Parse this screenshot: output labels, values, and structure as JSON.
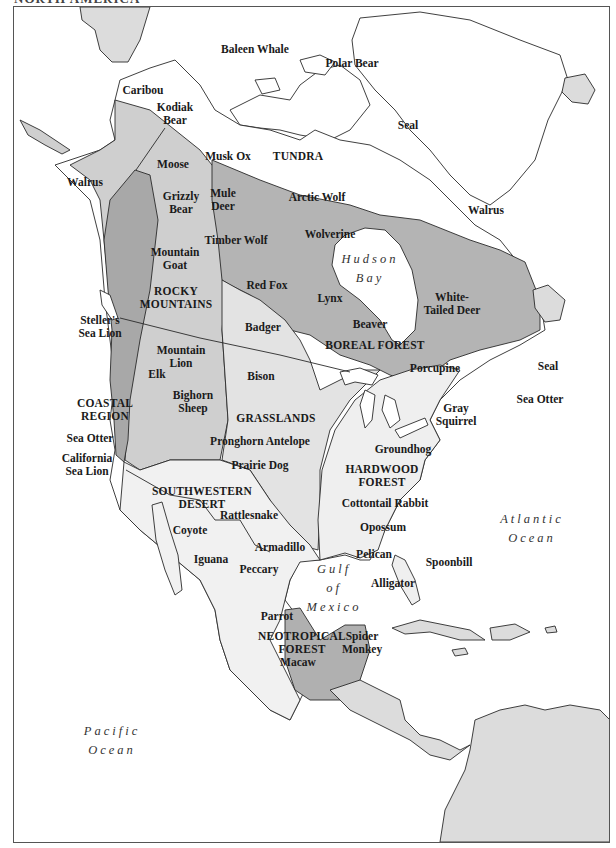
{
  "title_cut": "NORTH AMERICA",
  "colors": {
    "background": "#ffffff",
    "land_outline": "#2a2a2a",
    "other_land": "#dcdcdc",
    "tundra": "#ffffff",
    "boreal_forest": "#b4b4b4",
    "rocky_mountains": "#cfcfcf",
    "coastal_region": "#a8a8a8",
    "grasslands": "#e3e3e3",
    "hardwood_forest": "#efefef",
    "southwestern_desert": "#f1f1f1",
    "neotropical_forest": "#b0b0b0"
  },
  "regions": [
    {
      "name": "TUNDRA",
      "lines": [
        "TUNDRA"
      ]
    },
    {
      "name": "ROCKY MOUNTAINS",
      "lines": [
        "ROCKY",
        "MOUNTAINS"
      ]
    },
    {
      "name": "BOREAL FOREST",
      "lines": [
        "BOREAL FOREST"
      ]
    },
    {
      "name": "COASTAL REGION",
      "lines": [
        "COASTAL",
        "REGION"
      ]
    },
    {
      "name": "GRASSLANDS",
      "lines": [
        "GRASSLANDS"
      ]
    },
    {
      "name": "HARDWOOD FOREST",
      "lines": [
        "HARDWOOD",
        "FOREST"
      ]
    },
    {
      "name": "SOUTHWESTERN DESERT",
      "lines": [
        "SOUTHWESTERN",
        "DESERT"
      ]
    },
    {
      "name": "NEOTROPICAL FOREST",
      "lines": [
        "NEOTROPICAL",
        "FOREST"
      ]
    }
  ],
  "water_bodies": [
    {
      "lines": [
        "Hudson",
        "Bay"
      ]
    },
    {
      "lines": [
        "Atlantic",
        "Ocean"
      ]
    },
    {
      "lines": [
        "Gulf",
        "of",
        "Mexico"
      ]
    },
    {
      "lines": [
        "Pacific",
        "Ocean"
      ]
    }
  ],
  "animals": [
    {
      "lines": [
        "Baleen Whale"
      ]
    },
    {
      "lines": [
        "Polar Bear"
      ]
    },
    {
      "lines": [
        "Caribou"
      ]
    },
    {
      "lines": [
        "Kodiak",
        "Bear"
      ]
    },
    {
      "lines": [
        "Seal"
      ]
    },
    {
      "lines": [
        "Moose"
      ]
    },
    {
      "lines": [
        "Musk Ox"
      ]
    },
    {
      "lines": [
        "Walrus"
      ]
    },
    {
      "lines": [
        "Arctic Wolf"
      ]
    },
    {
      "lines": [
        "Walrus"
      ]
    },
    {
      "lines": [
        "Grizzly",
        "Bear"
      ]
    },
    {
      "lines": [
        "Mule",
        "Deer"
      ]
    },
    {
      "lines": [
        "Wolverine"
      ]
    },
    {
      "lines": [
        "Timber Wolf"
      ]
    },
    {
      "lines": [
        "Mountain",
        "Goat"
      ]
    },
    {
      "lines": [
        "Red Fox"
      ]
    },
    {
      "lines": [
        "Lynx"
      ]
    },
    {
      "lines": [
        "White-",
        "Tailed Deer"
      ]
    },
    {
      "lines": [
        "Steller's",
        "Sea Lion"
      ]
    },
    {
      "lines": [
        "Badger"
      ]
    },
    {
      "lines": [
        "Beaver"
      ]
    },
    {
      "lines": [
        "Mountain",
        "Lion"
      ]
    },
    {
      "lines": [
        "Elk"
      ]
    },
    {
      "lines": [
        "Bison"
      ]
    },
    {
      "lines": [
        "Porcupine"
      ]
    },
    {
      "lines": [
        "Seal"
      ]
    },
    {
      "lines": [
        "Bighorn",
        "Sheep"
      ]
    },
    {
      "lines": [
        "Sea Otter"
      ]
    },
    {
      "lines": [
        "Gray",
        "Squirrel"
      ]
    },
    {
      "lines": [
        "Sea Otter"
      ]
    },
    {
      "lines": [
        "Pronghorn Antelope"
      ]
    },
    {
      "lines": [
        "California",
        "Sea Lion"
      ]
    },
    {
      "lines": [
        "Groundhog"
      ]
    },
    {
      "lines": [
        "Prairie Dog"
      ]
    },
    {
      "lines": [
        "Cottontail Rabbit"
      ]
    },
    {
      "lines": [
        "Rattlesnake"
      ]
    },
    {
      "lines": [
        "Coyote"
      ]
    },
    {
      "lines": [
        "Opossum"
      ]
    },
    {
      "lines": [
        "Armadillo"
      ]
    },
    {
      "lines": [
        "Iguana"
      ]
    },
    {
      "lines": [
        "Pelican"
      ]
    },
    {
      "lines": [
        "Peccary"
      ]
    },
    {
      "lines": [
        "Spoonbill"
      ]
    },
    {
      "lines": [
        "Alligator"
      ]
    },
    {
      "lines": [
        "Parrot"
      ]
    },
    {
      "lines": [
        "Spider",
        "Monkey"
      ]
    },
    {
      "lines": [
        "Macaw"
      ]
    }
  ]
}
